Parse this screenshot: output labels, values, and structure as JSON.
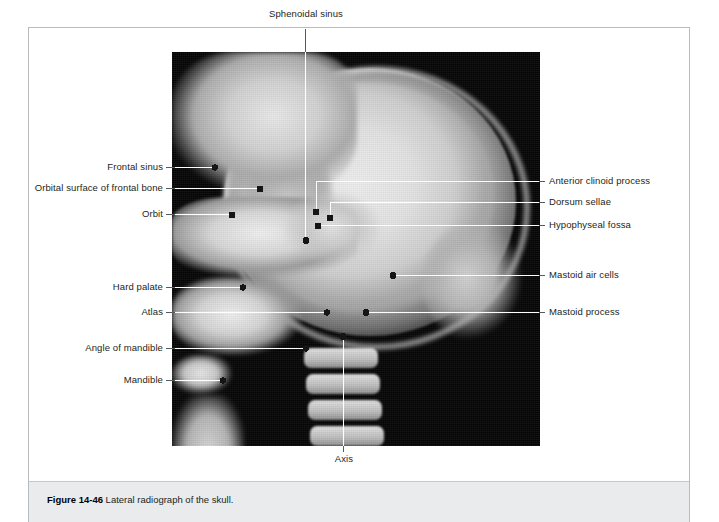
{
  "figure": {
    "caption_number": "Figure 14-46",
    "caption_body": "Lateral radiograph of the skull.",
    "image_alt": "lateral-skull-radiograph"
  },
  "colors": {
    "page_background": "#ffffff",
    "frame_border": "#b9bcbe",
    "caption_band": "#e9ebec",
    "text": "#231f20",
    "leader_line": "#ffffff",
    "leader_line_outside": "#58595b",
    "marker_dot": "#1a1a1a"
  },
  "labels": {
    "left": [
      {
        "id": "frontal-sinus",
        "text": "Frontal sinus"
      },
      {
        "id": "orbital-surface-of-frontal-bone",
        "text": "Orbital surface of frontal bone"
      },
      {
        "id": "orbit",
        "text": "Orbit"
      },
      {
        "id": "hard-palate",
        "text": "Hard palate"
      },
      {
        "id": "atlas",
        "text": "Atlas"
      },
      {
        "id": "angle-of-mandible",
        "text": "Angle of mandible"
      },
      {
        "id": "mandible",
        "text": "Mandible"
      }
    ],
    "right": [
      {
        "id": "anterior-clinoid-process",
        "text": "Anterior clinoid process"
      },
      {
        "id": "dorsum-sellae",
        "text": "Dorsum sellae"
      },
      {
        "id": "hypophyseal-fossa",
        "text": "Hypophyseal fossa"
      },
      {
        "id": "mastoid-air-cells",
        "text": "Mastoid air cells"
      },
      {
        "id": "mastoid-process",
        "text": "Mastoid process"
      }
    ],
    "top": [
      {
        "id": "sphenoidal-sinus",
        "text": "Sphenoidal sinus"
      }
    ],
    "bottom": [
      {
        "id": "axis",
        "text": "Axis"
      }
    ]
  }
}
